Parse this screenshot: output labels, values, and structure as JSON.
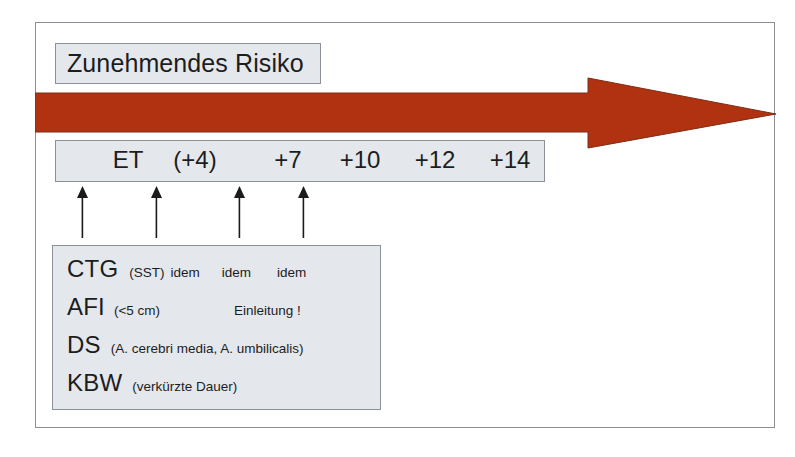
{
  "figure": {
    "title": "Zunehmendes Risiko",
    "arrow": {
      "name": "increasing-risk-arrow",
      "color": "#b03210",
      "direction": "right"
    },
    "frame_border_color": "#8a8f96",
    "panel_fill_color": "#e4e8ed",
    "panel_border_color": "#8b9099"
  },
  "timeline": {
    "items": [
      {
        "label": "ET",
        "x": 72,
        "marked": true
      },
      {
        "label": "(+4)",
        "x": 139,
        "marked": true
      },
      {
        "label": "+7",
        "x": 232,
        "marked": true
      },
      {
        "label": "+10",
        "x": 304,
        "marked": true
      },
      {
        "label": "+12",
        "x": 379,
        "marked": false
      },
      {
        "label": "+14",
        "x": 454,
        "marked": false
      }
    ],
    "markers": [
      {
        "name": "marker-et",
        "x": 82
      },
      {
        "name": "marker-p4",
        "x": 156
      },
      {
        "name": "marker-p7",
        "x": 239
      },
      {
        "name": "marker-p10",
        "x": 303
      }
    ]
  },
  "details": {
    "rows": [
      {
        "abbr": "CTG",
        "note": "(SST)",
        "repeats": [
          "idem",
          "idem",
          "idem"
        ]
      },
      {
        "abbr": "AFI",
        "note": "(<5 cm)",
        "extra": "Einleitung !"
      },
      {
        "abbr": "DS",
        "note": "(A. cerebri media, A. umbilicalis)"
      },
      {
        "abbr": "KBW",
        "note": "(verkürzte Dauer)"
      }
    ]
  }
}
